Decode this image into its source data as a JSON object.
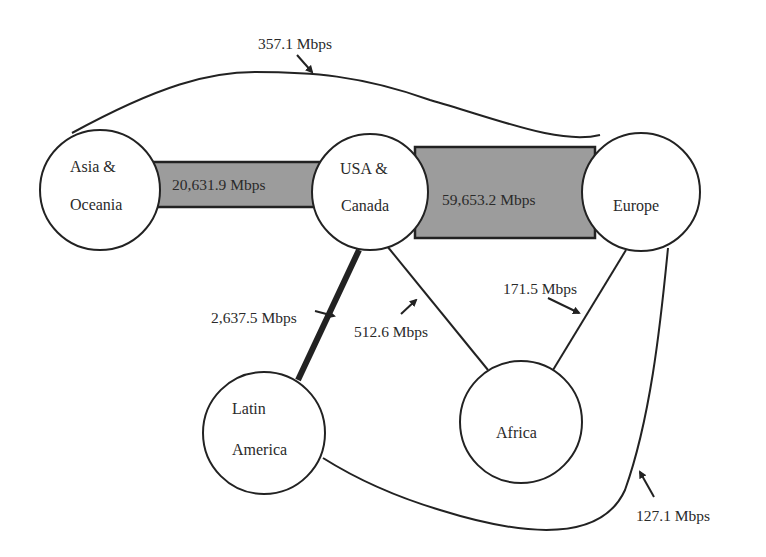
{
  "diagram": {
    "type": "network-flow",
    "colors": {
      "band_fill": "#9c9c9c",
      "stroke": "#222222",
      "background": "#ffffff"
    },
    "nodes": {
      "asia": {
        "line1": "Asia &",
        "line2": "Oceania"
      },
      "usa": {
        "line1": "USA &",
        "line2": "Canada"
      },
      "europe": {
        "line1": "Europe"
      },
      "latam": {
        "line1": "Latin",
        "line2": "America"
      },
      "africa": {
        "line1": "Africa"
      }
    },
    "edges": {
      "asia_usa": "20,631.9 Mbps",
      "usa_europe": "59,653.2 Mbps",
      "asia_europe": "357.1 Mbps",
      "usa_latam": "2,637.5 Mbps",
      "usa_africa": "512.6 Mbps",
      "europe_africa": "171.5 Mbps",
      "europe_latam": "127.1 Mbps"
    }
  }
}
